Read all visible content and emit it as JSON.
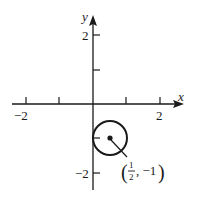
{
  "diagram": {
    "type": "coordinate-plane-circle",
    "axes": {
      "x_label": "x",
      "y_label": "y",
      "x_ticks": [
        -2,
        -1,
        1,
        2
      ],
      "y_ticks": [
        2,
        1,
        -1,
        -2
      ],
      "x_tick_labels": {
        "neg2": "−2",
        "pos2": "2"
      },
      "y_tick_labels": {
        "pos2": "2",
        "neg2": "−2"
      }
    },
    "circle": {
      "center": [
        0.5,
        -1
      ],
      "radius": 0.5,
      "center_label": {
        "open": "(",
        "numerator": "1",
        "denominator": "2",
        "rest": ", −1",
        "close": ")"
      }
    },
    "colors": {
      "stroke": "#1a1a1a",
      "background": "#ffffff"
    }
  }
}
